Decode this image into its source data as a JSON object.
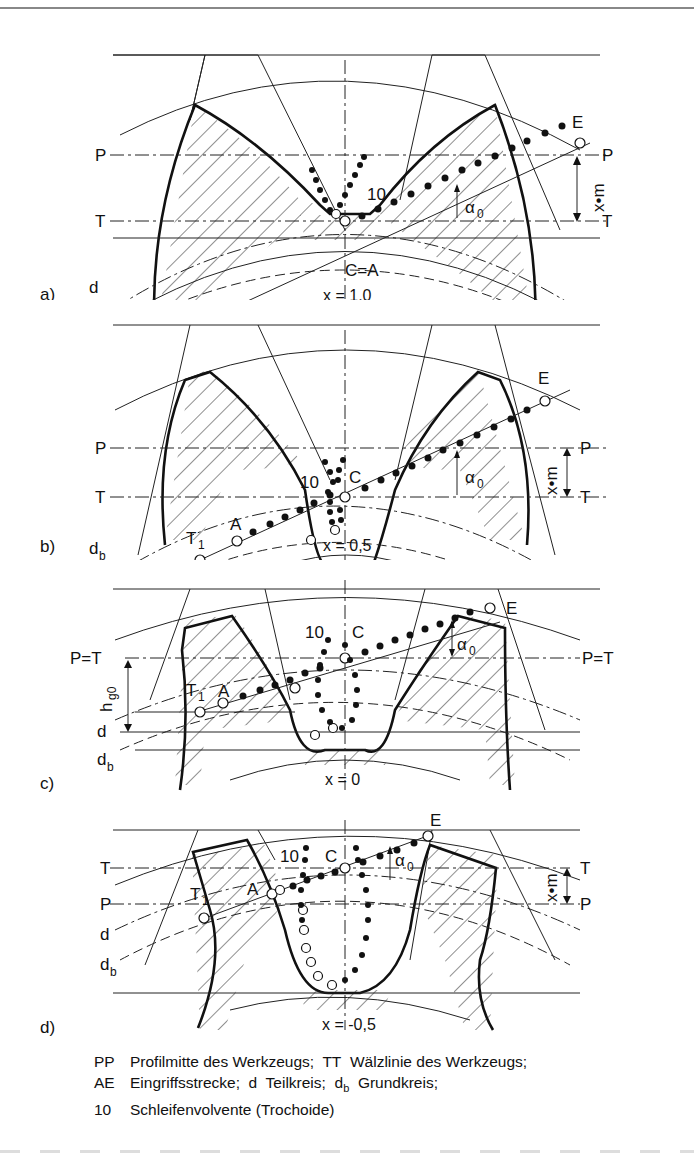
{
  "figure": {
    "panels": [
      {
        "id": "a",
        "label": "a)",
        "shift_caption": "x = 1,0",
        "line_labels": {
          "left_top": "P",
          "right_top": "P",
          "left_bottom": "T",
          "right_bottom": "T"
        },
        "point_labels": {
          "E": "E",
          "contact": "C=A",
          "T1": "T",
          "T1_sub": "1"
        },
        "trochoid_label": "10",
        "angle_label": "α",
        "angle_sub": "0",
        "dimension_label": "x•m",
        "circle_labels": {
          "d": "d",
          "db": "d",
          "db_sub": "b"
        }
      },
      {
        "id": "b",
        "label": "b)",
        "shift_caption": "x = 0,5",
        "line_labels": {
          "left_top": "P",
          "right_top": "P",
          "left_bottom": "T",
          "right_bottom": "T"
        },
        "point_labels": {
          "E": "E",
          "C": "C",
          "A": "A",
          "T1": "T",
          "T1_sub": "1"
        },
        "trochoid_label": "10",
        "angle_label": "α",
        "angle_sub": "0",
        "dimension_label": "x•m",
        "circle_labels": {
          "d": "d",
          "db": "d",
          "db_sub": "b"
        }
      },
      {
        "id": "c",
        "label": "c)",
        "shift_caption": "x = 0",
        "line_labels": {
          "left": "P=T",
          "right": "P=T"
        },
        "point_labels": {
          "E": "E",
          "C": "C",
          "A": "A",
          "T1": "T",
          "T1_sub": "1"
        },
        "trochoid_label": "10",
        "angle_label": "α",
        "angle_sub": "0",
        "dimension_label": "h",
        "dimension_sub": "g0",
        "circle_labels": {
          "d": "d",
          "db": "d",
          "db_sub": "b"
        }
      },
      {
        "id": "d",
        "label": "d)",
        "shift_caption": "x = -0,5",
        "line_labels": {
          "left_top": "T",
          "right_top": "T",
          "left_bottom": "P",
          "right_bottom": "P"
        },
        "point_labels": {
          "E": "E",
          "C": "C",
          "A": "A",
          "T1": "T",
          "T1_sub": "1"
        },
        "trochoid_label": "10",
        "angle_label": "α",
        "angle_sub": "0",
        "dimension_label": "x•m",
        "circle_labels": {
          "d": "d",
          "db": "d",
          "db_sub": "b"
        }
      }
    ],
    "legend": [
      {
        "key": "PP",
        "text": "Profilmitte des Werkzeugs;",
        "key2": "TT",
        "text2": "Wälzlinie des Werkzeugs;"
      },
      {
        "key": "AE",
        "text": "Eingriffsstrecke;",
        "key2": "d",
        "text2": "Teilkreis;",
        "key3": "d",
        "key3_sub": "b",
        "text3": "Grundkreis;"
      },
      {
        "key": "10",
        "text": "Schleifenvolvente (Trochoide)"
      }
    ]
  }
}
